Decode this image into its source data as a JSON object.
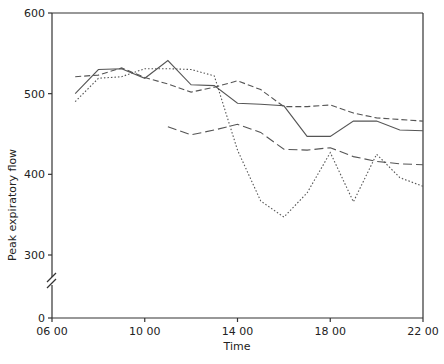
{
  "chart_data": {
    "type": "line",
    "title": "",
    "xlabel": "Time",
    "ylabel": "Peak expiratory flow",
    "x_ticks": [
      "06 00",
      "10 00",
      "14 00",
      "18 00",
      "22 00"
    ],
    "x_tick_hours": [
      6,
      10,
      14,
      18,
      22
    ],
    "y_ticks": [
      "0",
      "300",
      "400",
      "500",
      "600"
    ],
    "y_tick_values": [
      0,
      300,
      400,
      500,
      600
    ],
    "ylim": [
      300,
      600
    ],
    "xlim": [
      6,
      22
    ],
    "y_axis_break": true,
    "grid": false,
    "legend": "none",
    "series": [
      {
        "name": "solid",
        "style": "solid",
        "x": [
          7,
          8,
          9,
          10,
          11,
          12,
          13,
          14,
          15,
          16,
          17,
          18,
          19,
          20,
          21,
          22
        ],
        "values": [
          500,
          530,
          531,
          519,
          541,
          511,
          510,
          488,
          487,
          485,
          447,
          447,
          466,
          466,
          455,
          454
        ]
      },
      {
        "name": "long-dashed",
        "style": "dashed",
        "x": [
          7,
          8,
          9,
          10,
          11,
          12,
          13,
          14,
          15,
          16,
          17,
          18,
          19,
          20,
          21,
          22
        ],
        "values": [
          521,
          523,
          532,
          520,
          512,
          502,
          508,
          516,
          505,
          484,
          484,
          486,
          476,
          470,
          468,
          466
        ]
      },
      {
        "name": "dotted",
        "style": "dotted",
        "x": [
          7,
          8,
          9,
          10,
          11,
          12,
          13,
          14,
          15,
          16,
          17,
          18,
          19,
          20,
          21,
          22
        ],
        "values": [
          490,
          519,
          521,
          531,
          531,
          530,
          522,
          430,
          367,
          347,
          377,
          427,
          366,
          425,
          396,
          385
        ]
      },
      {
        "name": "medium-dashed",
        "style": "long-dash",
        "x": [
          11,
          12,
          13,
          14,
          15,
          16,
          17,
          18,
          19,
          20,
          21,
          22
        ],
        "values": [
          459,
          449,
          455,
          462,
          452,
          431,
          430,
          433,
          422,
          416,
          413,
          412
        ]
      }
    ]
  },
  "colors": {
    "line": "#555555",
    "axis": "#333333",
    "text": "#222222"
  }
}
